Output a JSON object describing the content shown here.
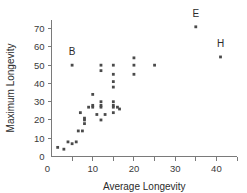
{
  "chart_data": {
    "type": "scatter",
    "title": "",
    "xlabel": "Average Longevity",
    "ylabel": "Maximum Longevity",
    "xlim": [
      0,
      45
    ],
    "ylim": [
      0,
      75
    ],
    "xticks": [
      0,
      5,
      10,
      15,
      20,
      25,
      30,
      35,
      40,
      45
    ],
    "xtick_labels": [
      "0",
      "",
      "10",
      "",
      "20",
      "",
      "30",
      "",
      "40",
      ""
    ],
    "yticks": [
      0,
      10,
      20,
      30,
      40,
      50,
      60,
      70
    ],
    "ytick_labels": [
      "0",
      "10",
      "20",
      "30",
      "40",
      "50",
      "60",
      "70"
    ],
    "grid": false,
    "legend": false,
    "points": [
      {
        "x": 1.5,
        "y": 5
      },
      {
        "x": 3,
        "y": 4
      },
      {
        "x": 4,
        "y": 8
      },
      {
        "x": 5,
        "y": 7
      },
      {
        "x": 5,
        "y": 50
      },
      {
        "x": 6,
        "y": 8
      },
      {
        "x": 6.5,
        "y": 14
      },
      {
        "x": 7,
        "y": 24
      },
      {
        "x": 7.5,
        "y": 14
      },
      {
        "x": 8,
        "y": 18
      },
      {
        "x": 8,
        "y": 20
      },
      {
        "x": 8,
        "y": 21
      },
      {
        "x": 9,
        "y": 27
      },
      {
        "x": 10,
        "y": 34
      },
      {
        "x": 10,
        "y": 27
      },
      {
        "x": 10,
        "y": 28
      },
      {
        "x": 11,
        "y": 23
      },
      {
        "x": 12,
        "y": 50
      },
      {
        "x": 12,
        "y": 47
      },
      {
        "x": 12,
        "y": 30
      },
      {
        "x": 12,
        "y": 28
      },
      {
        "x": 12,
        "y": 27
      },
      {
        "x": 12,
        "y": 20
      },
      {
        "x": 13,
        "y": 23
      },
      {
        "x": 15,
        "y": 50
      },
      {
        "x": 15,
        "y": 45
      },
      {
        "x": 15,
        "y": 41
      },
      {
        "x": 15,
        "y": 38
      },
      {
        "x": 15,
        "y": 30
      },
      {
        "x": 15,
        "y": 28
      },
      {
        "x": 15,
        "y": 27
      },
      {
        "x": 15,
        "y": 24
      },
      {
        "x": 16,
        "y": 27
      },
      {
        "x": 16.5,
        "y": 26
      },
      {
        "x": 20,
        "y": 54
      },
      {
        "x": 20,
        "y": 50
      },
      {
        "x": 20,
        "y": 45
      },
      {
        "x": 25,
        "y": 50
      },
      {
        "x": 35,
        "y": 71
      },
      {
        "x": 41,
        "y": 54.5
      }
    ],
    "annotations": [
      {
        "label": "B",
        "x": 5,
        "y": 50,
        "dx": 0,
        "dy": 5.5
      },
      {
        "label": "E",
        "x": 35,
        "y": 71,
        "dx": 0,
        "dy": 5.5
      },
      {
        "label": "H",
        "x": 41,
        "y": 54.5,
        "dx": 0,
        "dy": 5.5
      }
    ],
    "marker_color": "#4a4a4a",
    "axis_color": "#7a7a7a"
  }
}
